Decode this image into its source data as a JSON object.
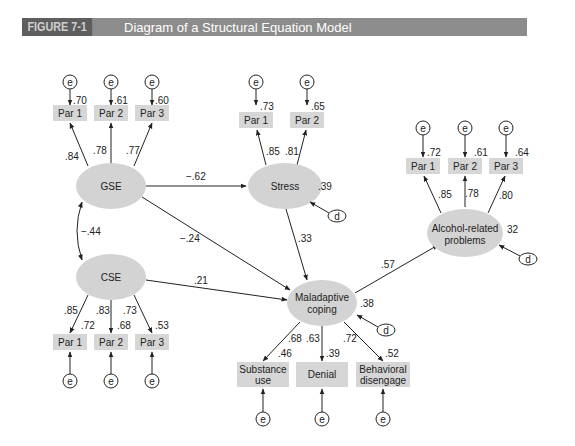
{
  "header": {
    "figure_number": "FIGURE 7-1",
    "title": "Diagram of a Structural Equation Model"
  },
  "colors": {
    "header_dark": "#5e5e5e",
    "header_light": "#8c8c8c",
    "ellipse_fill": "#d3d3d3",
    "box_fill": "#d6d6d6",
    "line": "#222222"
  },
  "labels": {
    "error": "e",
    "disturbance": "d"
  },
  "latent": {
    "gse": {
      "label": "GSE"
    },
    "cse": {
      "label": "CSE"
    },
    "stress": {
      "label": "Stress",
      "r2": ".39"
    },
    "coping": {
      "label_line1": "Maladaptive",
      "label_line2": "coping",
      "r2": ".38"
    },
    "alcohol": {
      "label_line1": "Alcohol-related",
      "label_line2": "problems",
      "r2": "32"
    }
  },
  "indicators": {
    "gse": [
      {
        "label": "Par 1",
        "loading": ".84",
        "r2": ".70"
      },
      {
        "label": "Par 2",
        "loading": ".78",
        "r2": ".61"
      },
      {
        "label": "Par 3",
        "loading": ".77",
        "r2": ".60"
      }
    ],
    "stress": [
      {
        "label": "Par 1",
        "loading": ".85",
        "r2": ".73"
      },
      {
        "label": "Par 2",
        "loading": ".81",
        "r2": ".65"
      }
    ],
    "alcohol": [
      {
        "label": "Par 1",
        "loading": ".85",
        "r2": ".72"
      },
      {
        "label": "Par 2",
        "loading": ".78",
        "r2": ".61"
      },
      {
        "label": "Par 3",
        "loading": ".80",
        "r2": ".64"
      }
    ],
    "cse": [
      {
        "label": "Par 1",
        "loading": ".85",
        "r2": ".72"
      },
      {
        "label": "Par 2",
        "loading": ".83",
        "r2": ".68"
      },
      {
        "label": "Par 3",
        "loading": ".73",
        "r2": ".53"
      }
    ],
    "coping": [
      {
        "label_line1": "Substance",
        "label_line2": "use",
        "loading": ".68",
        "r2": ".46"
      },
      {
        "label_line1": "Denial",
        "label_line2": "",
        "loading": ".63",
        "r2": ".39"
      },
      {
        "label_line1": "Behavioral",
        "label_line2": "disengage",
        "loading": ".72",
        "r2": ".52"
      }
    ]
  },
  "paths": {
    "gse_cse": "−.44",
    "gse_stress": "−.62",
    "gse_coping": "−.24",
    "cse_coping": ".21",
    "stress_coping": ".33",
    "coping_alcohol": ".57"
  }
}
